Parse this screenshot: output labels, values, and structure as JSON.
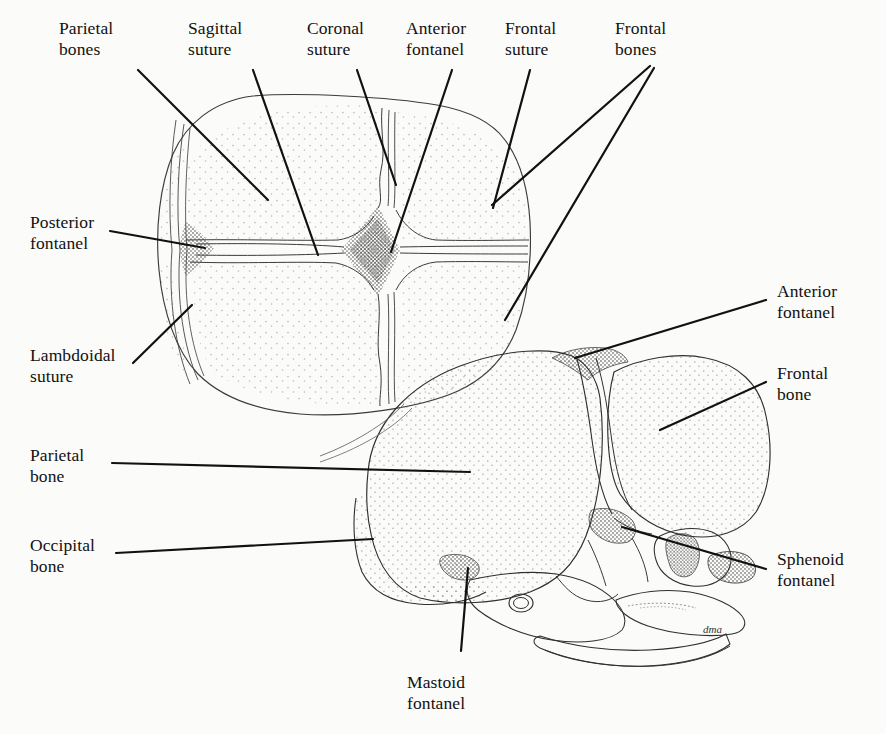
{
  "figure": {
    "signature": "dma",
    "background_color": "#fbfbf9",
    "ink_color": "#111111",
    "stipple_color": "#6b6b6b"
  },
  "labels": {
    "parietal_bones": "Parietal\nbones",
    "sagittal_suture": "Sagittal\nsuture",
    "coronal_suture": "Coronal\nsuture",
    "anterior_fontanel_top": "Anterior\nfontanel",
    "frontal_suture": "Frontal\nsuture",
    "frontal_bones": "Frontal\nbones",
    "posterior_fontanel": "Posterior\nfontanel",
    "lambdoidal_suture": "Lambdoidal\nsuture",
    "parietal_bone": "Parietal\nbone",
    "occipital_bone": "Occipital\nbone",
    "anterior_fontanel_side": "Anterior\nfontanel",
    "frontal_bone": "Frontal\nbone",
    "sphenoid_fontanel": "Sphenoid\nfontanel",
    "mastoid_fontanel": "Mastoid\nfontanel"
  },
  "views": {
    "superior": {
      "name": "superior-view",
      "description": "Top-down view of infant skull: two frontal bones, two parietal bones, sagittal suture running front-to-back, coronal suture, frontal (metopic) suture, diamond-shaped anterior fontanel, triangular posterior fontanel, lambdoidal suture"
    },
    "lateral": {
      "name": "lateral-view",
      "description": "Side view of infant skull: frontal bone, parietal bone, occipital bone, facial bones and orbit, anterior fontanel at top, sphenoid fontanel at anterolateral corner, mastoid fontanel at posterolateral corner"
    }
  },
  "structures": {
    "fontanels": [
      "Anterior fontanel",
      "Posterior fontanel",
      "Sphenoid fontanel",
      "Mastoid fontanel"
    ],
    "sutures": [
      "Sagittal suture",
      "Coronal suture",
      "Frontal suture",
      "Lambdoidal suture"
    ],
    "bones": [
      "Frontal bones",
      "Parietal bones",
      "Occipital bone"
    ]
  }
}
